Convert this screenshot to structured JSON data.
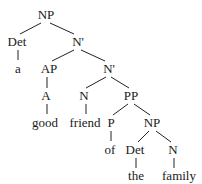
{
  "diagram": {
    "type": "syntax-tree",
    "phrase": "a good friend of the family",
    "nodes": [
      {
        "id": "np1",
        "label": "NP",
        "x": 46,
        "y": 8
      },
      {
        "id": "det1",
        "label": "Det",
        "x": 17,
        "y": 35
      },
      {
        "id": "a",
        "label": "a",
        "x": 18,
        "y": 62
      },
      {
        "id": "nbar1",
        "label": "N'",
        "x": 78,
        "y": 35
      },
      {
        "id": "ap",
        "label": "AP",
        "x": 49,
        "y": 62
      },
      {
        "id": "nbar2",
        "label": "N'",
        "x": 109,
        "y": 62
      },
      {
        "id": "adj",
        "label": "A",
        "x": 46,
        "y": 89
      },
      {
        "id": "good",
        "label": "good",
        "x": 45,
        "y": 116
      },
      {
        "id": "n1",
        "label": "N",
        "x": 84,
        "y": 89
      },
      {
        "id": "friend",
        "label": "friend",
        "x": 85,
        "y": 116
      },
      {
        "id": "pp",
        "label": "PP",
        "x": 131,
        "y": 89
      },
      {
        "id": "p",
        "label": "P",
        "x": 111,
        "y": 116
      },
      {
        "id": "of",
        "label": "of",
        "x": 110,
        "y": 143
      },
      {
        "id": "np2",
        "label": "NP",
        "x": 152,
        "y": 116
      },
      {
        "id": "det2",
        "label": "Det",
        "x": 135,
        "y": 143
      },
      {
        "id": "the",
        "label": "the",
        "x": 136,
        "y": 169
      },
      {
        "id": "n2",
        "label": "N",
        "x": 173,
        "y": 143
      },
      {
        "id": "family",
        "label": "family",
        "x": 179,
        "y": 169
      }
    ],
    "edges": [
      {
        "from": "np1",
        "to": "det1",
        "x1": 41,
        "y1": 23,
        "x2": 20,
        "y2": 34
      },
      {
        "from": "np1",
        "to": "nbar1",
        "x1": 50,
        "y1": 23,
        "x2": 74,
        "y2": 34
      },
      {
        "from": "det1",
        "to": "a",
        "x1": 18,
        "y1": 50,
        "x2": 18,
        "y2": 60
      },
      {
        "from": "nbar1",
        "to": "ap",
        "x1": 74,
        "y1": 50,
        "x2": 52,
        "y2": 61
      },
      {
        "from": "nbar1",
        "to": "nbar2",
        "x1": 81,
        "y1": 50,
        "x2": 105,
        "y2": 61
      },
      {
        "from": "ap",
        "to": "adj",
        "x1": 47,
        "y1": 77,
        "x2": 47,
        "y2": 88
      },
      {
        "from": "nbar2",
        "to": "n1",
        "x1": 106,
        "y1": 77,
        "x2": 86,
        "y2": 88
      },
      {
        "from": "nbar2",
        "to": "pp",
        "x1": 111,
        "y1": 77,
        "x2": 129,
        "y2": 88
      },
      {
        "from": "adj",
        "to": "good",
        "x1": 47,
        "y1": 104,
        "x2": 47,
        "y2": 114
      },
      {
        "from": "n1",
        "to": "friend",
        "x1": 86,
        "y1": 104,
        "x2": 86,
        "y2": 114
      },
      {
        "from": "pp",
        "to": "p",
        "x1": 128,
        "y1": 104,
        "x2": 113,
        "y2": 115
      },
      {
        "from": "pp",
        "to": "np2",
        "x1": 134,
        "y1": 104,
        "x2": 150,
        "y2": 115
      },
      {
        "from": "p",
        "to": "of",
        "x1": 111,
        "y1": 131,
        "x2": 111,
        "y2": 141
      },
      {
        "from": "np2",
        "to": "det2",
        "x1": 149,
        "y1": 131,
        "x2": 138,
        "y2": 142
      },
      {
        "from": "np2",
        "to": "n2",
        "x1": 156,
        "y1": 131,
        "x2": 171,
        "y2": 142
      },
      {
        "from": "det2",
        "to": "the",
        "x1": 136,
        "y1": 158,
        "x2": 136,
        "y2": 168
      },
      {
        "from": "n2",
        "to": "family",
        "x1": 174,
        "y1": 158,
        "x2": 174,
        "y2": 168
      }
    ]
  }
}
